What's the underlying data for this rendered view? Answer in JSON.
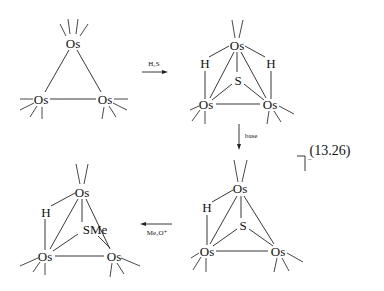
{
  "equation_number": "(13.26)",
  "charge": "−",
  "reagents": {
    "step1": "H₂S",
    "step2": "base",
    "step3": "Me₃O⁺"
  },
  "structures": [
    {
      "id": "Os3(CO)12",
      "atoms": {
        "os_top": "Os",
        "os_left": "Os",
        "os_right": "Os"
      }
    },
    {
      "id": "H2Os3(CO)9S",
      "atoms": {
        "os_top": "Os",
        "os_left": "Os",
        "os_right": "Os",
        "h_left": "H",
        "h_right": "H",
        "s": "S"
      }
    },
    {
      "id": "HOs3(CO)9S-anion",
      "atoms": {
        "os_top": "Os",
        "os_left": "Os",
        "os_right": "Os",
        "h_left": "H",
        "s": "S"
      }
    },
    {
      "id": "HOs3(CO)9SMe",
      "atoms": {
        "os_top": "Os",
        "os_left": "Os",
        "os_right": "Os",
        "h_left": "H",
        "sme": "SMe"
      }
    }
  ]
}
